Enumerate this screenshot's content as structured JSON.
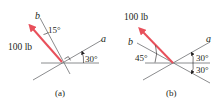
{
  "figures": [
    {
      "id": "a",
      "caption": "(a)",
      "force_label": "100 lb",
      "axis_a_label": "a",
      "axis_b_label": "b",
      "angle_force_to_b": "15°",
      "angle_a_to_horizontal": "30°",
      "right_angle_between_a_and_b": true
    },
    {
      "id": "b",
      "caption": "(b)",
      "force_label": "100 lb",
      "axis_a_label": "a",
      "axis_b_label": "b",
      "angle_force_to_horizontal": "45°",
      "angle_a_above_horizontal": "30°",
      "angle_below_horizontal": "30°"
    }
  ],
  "colors": {
    "force_arrow": "#e8505b",
    "lines": "#6d6e71",
    "text": "#231f20"
  }
}
